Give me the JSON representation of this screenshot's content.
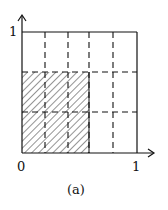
{
  "figure": {
    "caption": "(a)",
    "axes": {
      "x_origin_label": "0",
      "x_end_label": "1",
      "y_end_label": "1"
    },
    "grid": {
      "vertical_dashed_at": [
        0.2,
        0.4,
        0.6,
        0.8
      ],
      "horizontal_dashed_at": [
        0.333,
        0.667
      ]
    },
    "hatched_region": {
      "x": [
        0,
        0.6
      ],
      "y": [
        0,
        0.667
      ]
    },
    "colors": {
      "line": "#111111",
      "background": "#ffffff"
    }
  }
}
